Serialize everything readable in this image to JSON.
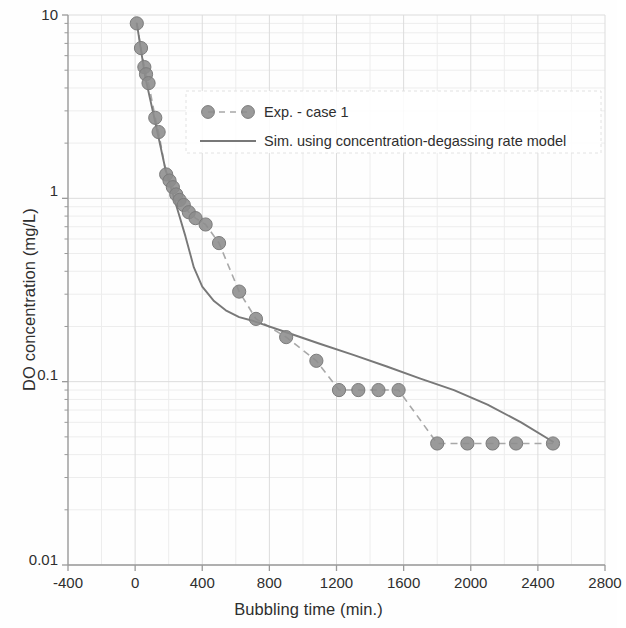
{
  "chart_data": {
    "type": "scatter",
    "title": "",
    "xlabel": "Bubbling time (min.)",
    "ylabel": "DO concentration (mg/L)",
    "xlim": [
      -400,
      2800
    ],
    "ylim": [
      0.01,
      10
    ],
    "yscale": "log",
    "xscale": "linear",
    "grid": true,
    "grid_minor": true,
    "legend_position": "upper center",
    "xticks": [
      -400,
      0,
      400,
      800,
      1200,
      1600,
      2000,
      2400,
      2800
    ],
    "xtick_labels": [
      "-400",
      "0",
      "400",
      "800",
      "1200",
      "1600",
      "2000",
      "2400",
      "2800"
    ],
    "yticks": [
      10,
      1,
      0.1,
      0.01
    ],
    "ytick_labels": [
      "10",
      "1",
      "0.1",
      "0.01"
    ],
    "series": [
      {
        "name": "Exp. - case 1",
        "style": "dashed-line-with-markers",
        "color": "#8c8c8c",
        "marker": "circle",
        "x": [
          10,
          35,
          55,
          65,
          80,
          120,
          140,
          185,
          205,
          225,
          245,
          265,
          290,
          320,
          360,
          420,
          500,
          620,
          720,
          900,
          1080,
          1215,
          1330,
          1450,
          1570,
          1800,
          1980,
          2130,
          2270,
          2490
        ],
        "y": [
          9.0,
          6.6,
          5.2,
          4.75,
          4.25,
          2.75,
          2.3,
          1.35,
          1.25,
          1.15,
          1.05,
          0.98,
          0.92,
          0.84,
          0.78,
          0.72,
          0.57,
          0.31,
          0.22,
          0.175,
          0.13,
          0.09,
          0.09,
          0.09,
          0.09,
          0.046,
          0.046,
          0.046,
          0.046,
          0.046
        ]
      },
      {
        "name": "Sim. using concentration-degassing rate model",
        "style": "solid-line",
        "color": "#7a7a7a",
        "marker": "none",
        "x": [
          10,
          60,
          120,
          180,
          240,
          300,
          350,
          400,
          470,
          540,
          620,
          700,
          900,
          1100,
          1300,
          1500,
          1700,
          1900,
          2100,
          2300,
          2490
        ],
        "y": [
          9.0,
          4.6,
          2.6,
          1.45,
          0.95,
          0.62,
          0.42,
          0.33,
          0.275,
          0.245,
          0.225,
          0.215,
          0.186,
          0.161,
          0.14,
          0.121,
          0.104,
          0.09,
          0.075,
          0.06,
          0.047
        ]
      }
    ]
  },
  "legend": {
    "items": [
      {
        "label": "Exp. - case 1",
        "type": "marker-dashed"
      },
      {
        "label": "Sim. using concentration-degassing rate model",
        "type": "line"
      }
    ]
  },
  "colors": {
    "marker": "#8c8c8c",
    "marker_edge": "#7c7c7c",
    "sim_line": "#787878",
    "dash_line": "#a8a8a8",
    "axis": "#9a9a9a",
    "grid_major": "#dcdcdc",
    "grid_minor": "#ededed",
    "text": "#2e2e2e",
    "background": "#fefefe"
  }
}
